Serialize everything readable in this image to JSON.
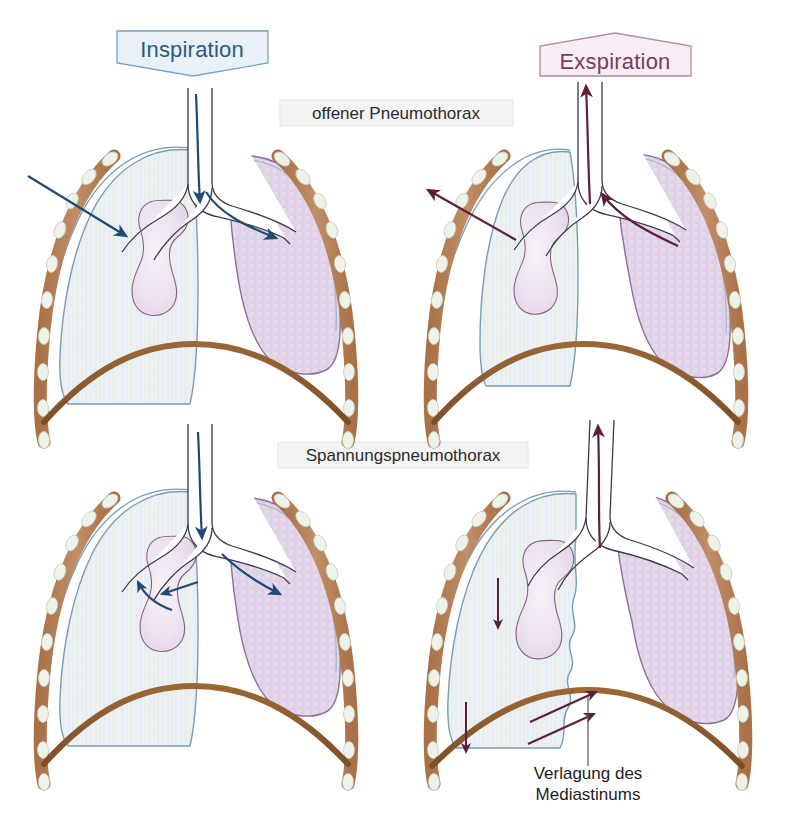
{
  "figure": {
    "background_color": "#ffffff"
  },
  "labels": {
    "inspiration": "Inspiration",
    "exspiration": "Exspiration",
    "open_pneumothorax": "offener Pneumothorax",
    "tension_pneumothorax": "Spannungspneumothorax",
    "mediastinal_shift_line1": "Verlagung des",
    "mediastinal_shift_line2": "Mediastinums"
  },
  "colors": {
    "inspiration_fill": "#e8f1f7",
    "inspiration_stroke": "#7ba3bf",
    "inspiration_text": "#2c5a78",
    "exspiration_fill": "#f6eef4",
    "exspiration_stroke": "#b08aa3",
    "exspiration_text": "#7d3a5c",
    "condition_box_fill": "#f4f4f4",
    "condition_box_stroke": "#e0e0e0",
    "arrow_inspiration": "#1f4a73",
    "arrow_exspiration": "#5e1f3f",
    "rib_bone": "#c08a5e",
    "rib_cartilage": "#eef2e8",
    "diaphragm": "#8a5a32",
    "lung_normal": "#eef5f2",
    "lung_collapsed": "#e2d7e8",
    "lung_outline": "#7a9bb5",
    "collapsed_outline": "#8d6d97",
    "heart_fill": "#ece3ef",
    "heart_outline": "#8a5f7e",
    "airway_stroke": "#3a3a4a",
    "pointer_line": "#555555"
  },
  "panels": [
    {
      "id": "top-left",
      "phase": "Inspiration",
      "condition": "offener Pneumothorax",
      "left_lung_state": "normal",
      "right_lung_state": "collapsed",
      "arrow_color_key": "arrow_inspiration",
      "arrows": [
        {
          "name": "chest-wall-inflow-arrow",
          "description": "air entering through chest wall defect"
        },
        {
          "name": "trachea-inflow-arrow",
          "description": "air descending trachea"
        },
        {
          "name": "bronchus-outflow-arrow",
          "description": "air shunted to collapsed side"
        }
      ]
    },
    {
      "id": "top-right",
      "phase": "Exspiration",
      "condition": "offener Pneumothorax",
      "left_lung_state": "normal",
      "right_lung_state": "collapsed",
      "arrow_color_key": "arrow_exspiration",
      "arrows": [
        {
          "name": "chest-wall-outflow-arrow",
          "description": "air escaping through chest wall defect"
        },
        {
          "name": "trachea-outflow-arrow",
          "description": "air ascending trachea"
        },
        {
          "name": "bronchus-inflow-arrow",
          "description": "pendelluft returning from collapsed side"
        }
      ]
    },
    {
      "id": "bottom-left",
      "phase": "Inspiration",
      "condition": "Spannungspneumothorax",
      "left_lung_state": "normal",
      "right_lung_state": "collapsed",
      "arrow_color_key": "arrow_inspiration",
      "arrows": [
        {
          "name": "trachea-inflow-arrow",
          "description": "air descending trachea"
        },
        {
          "name": "mediastinum-push-arrow",
          "description": "mediastinum pushed toward healthy side"
        },
        {
          "name": "mediastinum-lateral-arrow",
          "description": "lateral mediastinal displacement"
        },
        {
          "name": "bronchus-outflow-arrow",
          "description": "air shunted to affected side"
        }
      ]
    },
    {
      "id": "bottom-right",
      "phase": "Exspiration",
      "condition": "Spannungspneumothorax",
      "left_lung_state": "normal",
      "right_lung_state": "collapsed",
      "arrow_color_key": "arrow_exspiration",
      "callout": "Verlagung des Mediastinums",
      "arrows": [
        {
          "name": "trachea-outflow-arrow",
          "description": "air ascending trachea"
        },
        {
          "name": "lung-compression-arrow-upper",
          "description": "downward compression on healthy lung"
        },
        {
          "name": "lung-compression-arrow-lower",
          "description": "downward compression near diaphragm"
        },
        {
          "name": "mediastinum-shift-arrow-upper",
          "description": "mediastinum shifted toward healthy side"
        },
        {
          "name": "mediastinum-shift-arrow-lower",
          "description": "mediastinum shifted toward healthy side"
        }
      ]
    }
  ]
}
